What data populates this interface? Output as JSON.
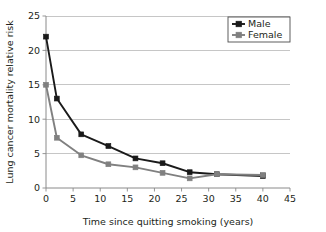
{
  "chart_data": {
    "type": "line",
    "title": "",
    "xlabel": "Time since quitting smoking (years)",
    "ylabel": "Lung cancer mortality relative risk",
    "xlim": [
      0,
      45
    ],
    "ylim": [
      0,
      25
    ],
    "xticks": [
      0,
      5,
      10,
      15,
      20,
      25,
      30,
      35,
      40,
      45
    ],
    "yticks": [
      0,
      5,
      10,
      15,
      20,
      25
    ],
    "xtick_labels": [
      "0",
      "5",
      "10",
      "15",
      "20",
      "25",
      "30",
      "35",
      "40",
      "45"
    ],
    "ytick_labels": [
      "0",
      "5",
      "10",
      "15",
      "20",
      "25"
    ],
    "grid": "horizontal",
    "legend_position": "top-right",
    "series": [
      {
        "name": "Male",
        "color": "#1a1a1a",
        "marker": "square",
        "x": [
          0,
          2,
          6.5,
          11.5,
          16.5,
          21.5,
          26.5,
          31.5,
          40
        ],
        "values": [
          22,
          13,
          7.8,
          6.1,
          4.3,
          3.6,
          2.3,
          2.0,
          1.75
        ]
      },
      {
        "name": "Female",
        "color": "#808080",
        "marker": "square",
        "x": [
          0,
          2,
          6.5,
          11.5,
          16.5,
          21.5,
          26.5,
          31.5,
          40
        ],
        "values": [
          15,
          7.3,
          4.75,
          3.45,
          3.0,
          2.2,
          1.4,
          2.0,
          1.9
        ]
      }
    ]
  },
  "legend": {
    "entries": [
      {
        "label": "Male"
      },
      {
        "label": "Female"
      }
    ]
  },
  "colors": {
    "male": "#1a1a1a",
    "female": "#808080",
    "gridline": "#b8b8b8",
    "axis": "#8a8a8a",
    "background": "#ffffff",
    "text": "#231f20"
  }
}
